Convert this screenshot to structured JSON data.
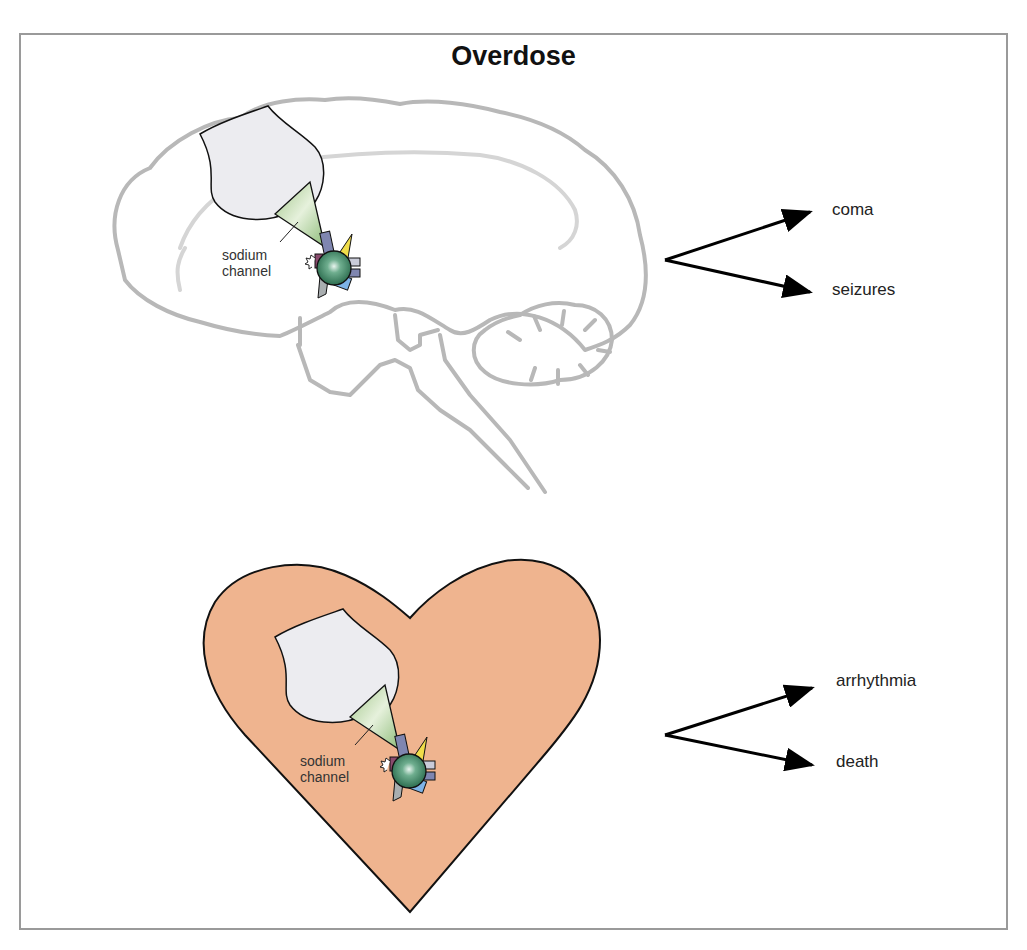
{
  "figure": {
    "title": "Overdose",
    "colors": {
      "frame_border": "#9a9a9a",
      "brain_outline": "#b5b5b5",
      "heart_fill": "#efb48f",
      "heart_outline": "#111111",
      "neuron_fill": "#ececf0",
      "sodium_channel_fill": "#b9d6a6",
      "drug_molecule": "#3e8a68",
      "arrow": "#000000"
    },
    "panels": [
      {
        "organ": "brain",
        "channel_label_line1": "sodium",
        "channel_label_line2": "channel",
        "outcomes": [
          "coma",
          "seizures"
        ]
      },
      {
        "organ": "heart",
        "channel_label_line1": "sodium",
        "channel_label_line2": "channel",
        "outcomes": [
          "arrhythmia",
          "death"
        ]
      }
    ]
  }
}
